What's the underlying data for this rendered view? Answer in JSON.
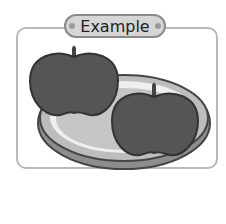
{
  "label": {
    "text": "Example"
  },
  "illustration": {
    "subject": "two apples on an oval plate",
    "items": [
      "apple",
      "apple",
      "plate"
    ]
  },
  "colors": {
    "frame_border": "#b9b9b9",
    "label_fill": "#d6d6d6",
    "apple_fill": "#555555",
    "plate_fill": "#c8c8c8"
  }
}
